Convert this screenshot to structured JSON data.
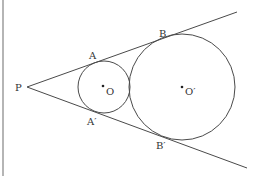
{
  "diagram": {
    "points": {
      "P": {
        "label": "P",
        "x": 27,
        "y": 87
      },
      "A": {
        "label": "A",
        "x": 98,
        "y": 62
      },
      "B": {
        "label": "B",
        "x": 166,
        "y": 37
      },
      "A_prime": {
        "label": "A′",
        "x": 98,
        "y": 112
      },
      "B_prime": {
        "label": "B′",
        "x": 166,
        "y": 137
      },
      "O": {
        "label": "O",
        "x": 103,
        "y": 87
      },
      "O_prime": {
        "label": "O′",
        "x": 182,
        "y": 87
      }
    },
    "circles": [
      {
        "name": "small-circle",
        "center": "O",
        "cx": 104,
        "cy": 87,
        "r": 26
      },
      {
        "name": "large-circle",
        "center": "O_prime",
        "cx": 182,
        "cy": 87,
        "r": 53
      }
    ],
    "lines": [
      {
        "name": "upper-tangent",
        "from": "P",
        "x1": 27,
        "y1": 87,
        "x2": 237,
        "y2": 12
      },
      {
        "name": "lower-tangent",
        "from": "P",
        "x1": 27,
        "y1": 87,
        "x2": 247,
        "y2": 168
      }
    ],
    "labels": {
      "P": "P",
      "A": "A",
      "B": "B",
      "A_prime": "A′",
      "B_prime": "B′",
      "O": "O",
      "O_prime": "O′"
    },
    "colors": {
      "stroke": "#4a4a4a",
      "border": "#b5b5b5",
      "text": "#333333"
    }
  }
}
